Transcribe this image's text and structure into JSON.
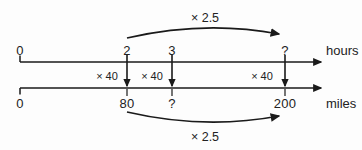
{
  "diagram": {
    "ink_color": "#1a1a1a",
    "background": "#fdfdfd",
    "top_axis": {
      "unit_label": "hours",
      "ticks": [
        {
          "label": "0",
          "x": 20
        },
        {
          "label": "2",
          "x": 127
        },
        {
          "label": "3",
          "x": 172
        },
        {
          "label": "?",
          "x": 285
        }
      ]
    },
    "bottom_axis": {
      "unit_label": "miles",
      "ticks": [
        {
          "label": "0",
          "x": 20
        },
        {
          "label": "80",
          "x": 127
        },
        {
          "label": "?",
          "x": 172
        },
        {
          "label": "200",
          "x": 285
        }
      ]
    },
    "vertical_links": [
      {
        "label": "× 40",
        "tick_x": 127,
        "label_x": 107
      },
      {
        "label": "× 40",
        "tick_x": 172,
        "label_x": 152
      },
      {
        "label": "× 40",
        "tick_x": 285,
        "label_x": 262
      }
    ],
    "top_arc": {
      "label": "× 2.5",
      "label_x": 205,
      "from_label": "2",
      "to_label": "?"
    },
    "bottom_arc": {
      "label": "× 2.5",
      "label_x": 205,
      "from_label": "80",
      "to_label": "200"
    }
  }
}
